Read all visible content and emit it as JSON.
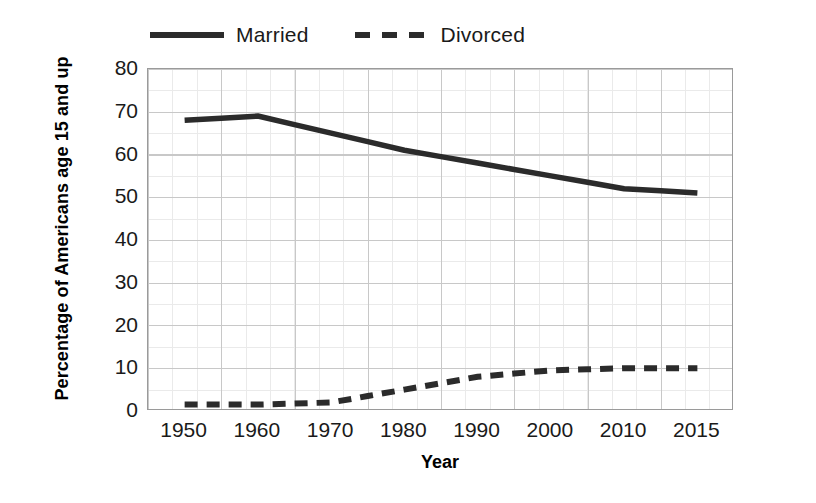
{
  "chart_data": {
    "type": "line",
    "title": "",
    "xlabel": "Year",
    "ylabel": "Percentage of Americans age 15 and up",
    "xlim": [
      1950,
      2015
    ],
    "ylim": [
      0,
      80
    ],
    "grid": true,
    "legend_position": "top",
    "x": [
      1950,
      1960,
      1970,
      1980,
      1990,
      2000,
      2010,
      2015
    ],
    "xticklabels": [
      "1950",
      "1960",
      "1970",
      "1980",
      "1990",
      "2000",
      "2010",
      "2015"
    ],
    "yticklabels": [
      "0",
      "10",
      "20",
      "30",
      "40",
      "50",
      "60",
      "70",
      "80"
    ],
    "ytickvalues": [
      0,
      10,
      20,
      30,
      40,
      50,
      60,
      70,
      80
    ],
    "series": [
      {
        "name": "Married",
        "style": "solid",
        "color": "#2b2b2b",
        "values": [
          68,
          69,
          65,
          61,
          58,
          55,
          52,
          51
        ]
      },
      {
        "name": "Divorced",
        "style": "dashed",
        "color": "#2b2b2b",
        "values": [
          1.5,
          1.5,
          2,
          5,
          8,
          9.5,
          10,
          10
        ]
      }
    ]
  },
  "legend": {
    "entries": [
      {
        "label": "Married",
        "style": "solid"
      },
      {
        "label": "Divorced",
        "style": "dashed"
      }
    ]
  },
  "axes": {
    "y_title": "Percentage of Americans age 15 and up",
    "x_title": "Year"
  }
}
